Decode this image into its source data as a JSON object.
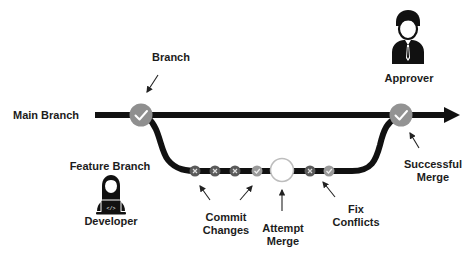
{
  "diagram": {
    "type": "git-branching-workflow",
    "colors": {
      "line": "#111111",
      "node_check": "#8f8f8f",
      "node_x": "#555555",
      "node_open_stroke": "#bdbdbd",
      "arrow": "#222222",
      "text": "#1c1c1c"
    },
    "labels": {
      "branch": "Branch",
      "main_branch": "Main Branch",
      "approver": "Approver",
      "feature_branch": "Feature Branch",
      "developer": "Developer",
      "commit_changes": [
        "Commit",
        "Changes"
      ],
      "attempt_merge": [
        "Attempt",
        "Merge"
      ],
      "fix_conflicts": [
        "Fix",
        "Conflicts"
      ],
      "successful_merge": [
        "Successful",
        "Merge"
      ]
    },
    "nodes": [
      {
        "id": "branch-point",
        "kind": "check",
        "branch": "main"
      },
      {
        "id": "commit-1",
        "kind": "x",
        "branch": "feature"
      },
      {
        "id": "commit-2",
        "kind": "x",
        "branch": "feature"
      },
      {
        "id": "commit-3",
        "kind": "x",
        "branch": "feature"
      },
      {
        "id": "commit-4",
        "kind": "check",
        "branch": "feature"
      },
      {
        "id": "attempt-merge",
        "kind": "open",
        "branch": "feature"
      },
      {
        "id": "commit-5",
        "kind": "x",
        "branch": "feature"
      },
      {
        "id": "commit-6",
        "kind": "check",
        "branch": "feature"
      },
      {
        "id": "merge-point",
        "kind": "check",
        "branch": "main"
      }
    ],
    "icons": {
      "approver": "businessman-icon",
      "developer": "developer-laptop-icon",
      "check": "checkmark-icon",
      "x": "x-mark-icon"
    }
  }
}
